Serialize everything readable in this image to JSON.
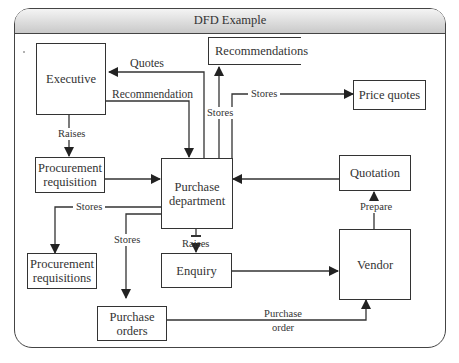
{
  "window": {
    "title": "DFD Example"
  },
  "nodes": {
    "executive": "Executive",
    "procurement_requisition_1": "Procurement",
    "procurement_requisition_2": "requisition",
    "purchase_department_1": "Purchase",
    "purchase_department_2": "department",
    "quotation": "Quotation",
    "vendor": "Vendor",
    "enquiry": "Enquiry"
  },
  "stores": {
    "recommendations": "Recommendations",
    "price_quotes": "Price quotes",
    "procurement_requisitions_1": "Procurement",
    "procurement_requisitions_2": "requisitions",
    "purchase_orders_1": "Purchase",
    "purchase_orders_2": "orders"
  },
  "flows": {
    "quotes": "Quotes",
    "recommendation": "Recommendation",
    "raises_exec": "Raises",
    "stores_recommendations": "Stores",
    "stores_price_quotes": "Stores",
    "stores_requisitions": "Stores",
    "stores_orders": "Stores",
    "raises_enquiry": "Raises",
    "prepare": "Prepare",
    "purchase_order_1": "Purchase",
    "purchase_order_2": "order"
  },
  "colors": {
    "line": "#333333",
    "titlebar_top": "#f4f4f4",
    "titlebar_bottom": "#c9c9c9"
  }
}
